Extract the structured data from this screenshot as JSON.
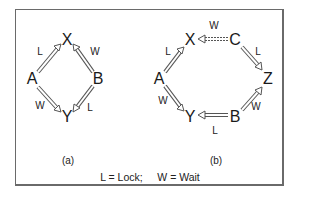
{
  "diagrams": [
    {
      "caption": "(a)",
      "nodes": [
        {
          "id": "X",
          "label": "X",
          "x": 67,
          "y": 40
        },
        {
          "id": "A",
          "label": "A",
          "x": 32,
          "y": 79
        },
        {
          "id": "B",
          "label": "B",
          "x": 98,
          "y": 79
        },
        {
          "id": "Y",
          "label": "Y",
          "x": 67,
          "y": 117
        }
      ],
      "edges": [
        {
          "from": "A",
          "to": "X",
          "label": "L",
          "type": "lock"
        },
        {
          "from": "B",
          "to": "X",
          "label": "W",
          "type": "wait"
        },
        {
          "from": "A",
          "to": "Y",
          "label": "W",
          "type": "wait"
        },
        {
          "from": "B",
          "to": "Y",
          "label": "L",
          "type": "lock"
        }
      ],
      "edge_labels": [
        {
          "text": "L",
          "x": 40,
          "y": 52
        },
        {
          "text": "W",
          "x": 95,
          "y": 52
        },
        {
          "text": "W",
          "x": 40,
          "y": 106
        },
        {
          "text": "L",
          "x": 90,
          "y": 108
        }
      ]
    },
    {
      "caption": "(b)",
      "nodes": [
        {
          "id": "X",
          "label": "X",
          "x": 190,
          "y": 40
        },
        {
          "id": "C",
          "label": "C",
          "x": 235,
          "y": 40
        },
        {
          "id": "A",
          "label": "A",
          "x": 159,
          "y": 79
        },
        {
          "id": "Z",
          "label": "Z",
          "x": 268,
          "y": 79
        },
        {
          "id": "Y",
          "label": "Y",
          "x": 190,
          "y": 117
        },
        {
          "id": "B",
          "label": "B",
          "x": 235,
          "y": 117
        }
      ],
      "edges": [
        {
          "from": "C",
          "to": "X",
          "label": "W",
          "type": "wait",
          "dashed": true
        },
        {
          "from": "C",
          "to": "Z",
          "label": "L",
          "type": "lock"
        },
        {
          "from": "A",
          "to": "X",
          "label": "L",
          "type": "lock"
        },
        {
          "from": "A",
          "to": "Y",
          "label": "W",
          "type": "wait"
        },
        {
          "from": "B",
          "to": "Y",
          "label": "L",
          "type": "lock"
        },
        {
          "from": "B",
          "to": "Z",
          "label": "W",
          "type": "wait"
        }
      ],
      "edge_labels": [
        {
          "text": "W",
          "x": 214,
          "y": 26
        },
        {
          "text": "L",
          "x": 258,
          "y": 52
        },
        {
          "text": "L",
          "x": 168,
          "y": 52
        },
        {
          "text": "W",
          "x": 163,
          "y": 101
        },
        {
          "text": "W",
          "x": 256,
          "y": 107
        },
        {
          "text": "L",
          "x": 215,
          "y": 131
        }
      ]
    }
  ],
  "captions": {
    "a": "(a)",
    "b": "(b)"
  },
  "legend": "L = Lock;     W = Wait",
  "colors": {
    "border": "#6a6a6a",
    "arrow_outline": "#555555",
    "text": "#1a1a1a"
  }
}
